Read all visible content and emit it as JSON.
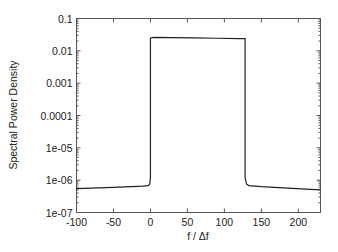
{
  "chart_data": {
    "type": "line",
    "title": "",
    "xlabel": "f / Δf",
    "ylabel": "Spectral Power Density",
    "xlim": [
      -100,
      230
    ],
    "ylim": [
      1e-07,
      0.1
    ],
    "yscale": "log",
    "grid": false,
    "legend": "none",
    "x_ticks": [
      -100,
      -50,
      0,
      50,
      100,
      150,
      200
    ],
    "x_tick_labels": [
      "-100",
      "-50",
      "0",
      "50",
      "100",
      "150",
      "200"
    ],
    "y_ticks": [
      1e-07,
      1e-06,
      1e-05,
      0.0001,
      0.001,
      0.01,
      0.1
    ],
    "y_tick_labels": [
      "1e-07",
      "1e-06",
      "1e-05",
      "0.0001",
      "0.001",
      "0.01",
      "0.1"
    ],
    "series": [
      {
        "name": "spectrum",
        "x": [
          -100,
          -50,
          -10,
          -3,
          -1,
          0,
          0,
          5,
          30,
          60,
          90,
          120,
          127,
          128,
          128,
          130,
          133,
          150,
          180,
          210,
          230
        ],
        "y": [
          5.5e-07,
          6e-07,
          6.5e-07,
          6.8e-07,
          7.5e-07,
          1.2e-06,
          0.025,
          0.026,
          0.0255,
          0.025,
          0.0245,
          0.024,
          0.024,
          0.024,
          1.2e-06,
          7.5e-07,
          6.8e-07,
          6.3e-07,
          5.8e-07,
          5.3e-07,
          5e-07
        ]
      }
    ]
  }
}
